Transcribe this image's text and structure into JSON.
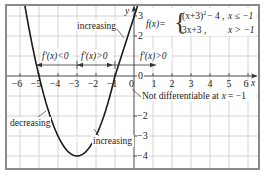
{
  "chart_data": {
    "type": "line",
    "title": "",
    "function_definition": {
      "lhs": "f(x)=",
      "piece_1": "(x+3)² − 4 ,",
      "piece_1_condition": "x ≤ −1",
      "piece_2": "3x+3 ,",
      "piece_2_condition": "x > −1"
    },
    "xlabel": "x",
    "ylabel": "y",
    "xlim": [
      -6.7,
      6.5
    ],
    "ylim": [
      -4.6,
      3.5
    ],
    "grid": true,
    "x_ticks": [
      "−6",
      "−5",
      "−4",
      "−3",
      "−2",
      "−1",
      "0",
      "1",
      "2",
      "3",
      "4",
      "5",
      "6"
    ],
    "x_tick_values": [
      -6,
      -5,
      -4,
      -3,
      -2,
      -1,
      0,
      1,
      2,
      3,
      4,
      5,
      6
    ],
    "y_ticks": [
      "3",
      "2",
      "0",
      "−2",
      "−3",
      "−4"
    ],
    "y_tick_values": [
      3,
      2,
      0,
      -2,
      -3,
      -4
    ],
    "series": [
      {
        "name": "(x+3)^2 - 4, x <= -1",
        "x": [
          -5.74,
          -5.5,
          -5,
          -4.5,
          -4,
          -3.5,
          -3,
          -2.5,
          -2,
          -1.5,
          -1
        ],
        "y": [
          3.5,
          2.25,
          0,
          -1.75,
          -3,
          -3.75,
          -4,
          -3.75,
          -3,
          -1.75,
          0
        ]
      },
      {
        "name": "3x+3, x > -1",
        "x": [
          -1,
          0,
          0.17
        ],
        "y": [
          0,
          3,
          3.5
        ]
      }
    ],
    "annotations": [
      {
        "text": "increasing",
        "target": "line segment x > -1"
      },
      {
        "text": "f′(x)<0",
        "interval": [
          -5,
          -3
        ]
      },
      {
        "text": "f′(x)>0",
        "interval": [
          -3,
          -1
        ]
      },
      {
        "text": "f′(x)>0",
        "interval": [
          -1,
          1
        ]
      },
      {
        "text": "Not differentiable at x = −1",
        "point": [
          -1,
          0
        ]
      },
      {
        "text": "decreasing",
        "target": "parabola left branch"
      },
      {
        "text": "increasing",
        "target": "parabola right branch"
      }
    ],
    "vertex": [
      -3,
      -4
    ]
  },
  "labels": {
    "y_axis": "y",
    "x_axis": "x",
    "origin": "0",
    "y_zero": "0",
    "formula_lhs": "f(x)=",
    "formula_piece1_expr": "(x+3)",
    "formula_piece1_exp": "2",
    "formula_piece1_rest": "− 4 ,",
    "formula_piece1_cond": "x ≤ −1",
    "formula_piece2_expr": "3x+3 ,",
    "formula_piece2_cond": "x > −1",
    "increasing_top": "increasing",
    "deriv_neg": "f′(x)<0",
    "deriv_pos_1": "f′(x)>0",
    "deriv_pos_2": "f′(x)>0",
    "not_diff": "Not differentiable at",
    "not_diff_x": "x",
    "not_diff_val": "= −1",
    "decreasing": "decreasing",
    "increasing_bottom": "increasing"
  },
  "ticks": {
    "x": [
      "−6",
      "−5",
      "−4",
      "−3",
      "−2",
      "−1",
      "1",
      "2",
      "3",
      "4",
      "5",
      "6"
    ],
    "y": [
      "3",
      "2",
      "−2",
      "−3",
      "−4"
    ]
  }
}
